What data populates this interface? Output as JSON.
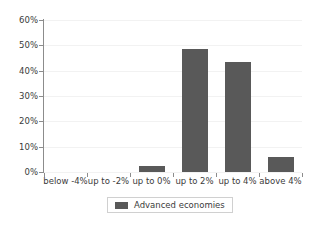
{
  "chart_data": {
    "type": "bar",
    "title": "",
    "subtitle": "",
    "xlabel": "",
    "ylabel": "",
    "categories": [
      "below -4%",
      "up to -2%",
      "up to 0%",
      "up to 2%",
      "up to 4%",
      "above 4%"
    ],
    "series": [
      {
        "name": "Advanced economies",
        "values": [
          0,
          0,
          2.5,
          48.5,
          43.5,
          6
        ],
        "color": "#595959"
      }
    ],
    "ylim": [
      0,
      60
    ],
    "ytick_values": [
      0,
      10,
      20,
      30,
      40,
      50,
      60
    ],
    "ytick_labels": [
      "0%",
      "10%",
      "20%",
      "30%",
      "40%",
      "50%",
      "60%"
    ],
    "grid": true,
    "grid_axis": "y",
    "grid_color": "#f2f2f2",
    "axis_color": "#8c8c8c",
    "legend_position": "bottom",
    "legend_entries": [
      "Advanced economies"
    ],
    "background_color": "#ffffff",
    "text_color": "#3b3b3b"
  },
  "legend": {
    "label": "Advanced economies",
    "swatch_name": "legend-color-swatch"
  }
}
